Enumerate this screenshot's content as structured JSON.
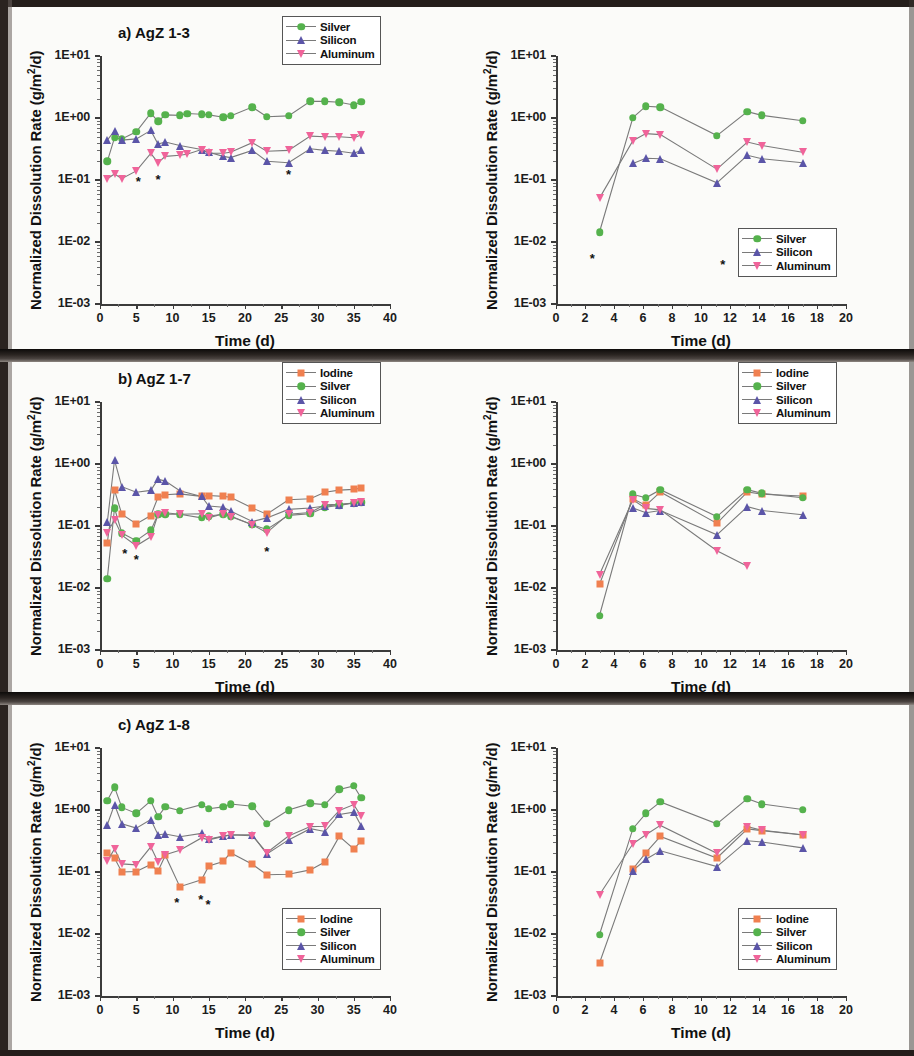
{
  "figure": {
    "axis_title_y": "Normalized Dissolution Rate (g/m2/d)",
    "axis_title_y_html": "Normalized Dissolution Rate (g/m²/d)",
    "axis_title_x": "Time (d)",
    "y_tick_labels": [
      "1E+01",
      "1E+00",
      "1E-01",
      "1E-02",
      "1E-03"
    ],
    "x_tick_labels_40": [
      "0",
      "5",
      "10",
      "15",
      "20",
      "25",
      "30",
      "35",
      "40"
    ],
    "x_tick_labels_20": [
      "0",
      "2",
      "4",
      "6",
      "8",
      "10",
      "12",
      "14",
      "16",
      "18",
      "20"
    ],
    "series_colors": {
      "Iodine": "#f08050",
      "Silver": "#55b24d",
      "Silicon": "#5b55a8",
      "Aluminum": "#f0649a",
      "line": "#7a7a7a",
      "star": "#111111"
    },
    "series_markers": {
      "Iodine": "square",
      "Silver": "circle",
      "Silicon": "triangle-up",
      "Aluminum": "triangle-down"
    }
  },
  "panels": [
    {
      "id": "a",
      "title": "a) AgZ 1-3",
      "legend_labels": [
        "Silver",
        "Silicon",
        "Aluminum"
      ],
      "legend_position": "top-right"
    },
    {
      "id": "a-right",
      "title": "",
      "legend_labels": [
        "Silver",
        "Silicon",
        "Aluminum"
      ],
      "legend_position": "bottom-right"
    },
    {
      "id": "b",
      "title": "b) AgZ 1-7",
      "legend_labels": [
        "Iodine",
        "Silver",
        "Silicon",
        "Aluminum"
      ],
      "legend_position": "top-right"
    },
    {
      "id": "b-right",
      "title": "",
      "legend_labels": [
        "Iodine",
        "Silver",
        "Silicon",
        "Aluminum"
      ],
      "legend_position": "top-right"
    },
    {
      "id": "c",
      "title": "c) AgZ 1-8",
      "legend_labels": [
        "Iodine",
        "Silver",
        "Silicon",
        "Aluminum"
      ],
      "legend_position": "bottom-right"
    },
    {
      "id": "c-right",
      "title": "",
      "legend_labels": [
        "Iodine",
        "Silver",
        "Silicon",
        "Aluminum"
      ],
      "legend_position": "bottom-right"
    }
  ],
  "chart_data": [
    {
      "panel": "a",
      "type": "line",
      "title": "a) AgZ 1-3",
      "xlabel": "Time (d)",
      "ylabel": "Normalized Dissolution Rate (g/m²/d)",
      "yscale": "log",
      "ylim": [
        0.001,
        10
      ],
      "xlim": [
        0,
        40
      ],
      "grid": false,
      "legend": "top-right",
      "series": [
        {
          "name": "Silver",
          "marker": "circle",
          "color": "#55b24d",
          "x": [
            1,
            2,
            3,
            5,
            7,
            8,
            9,
            11,
            12,
            14,
            15,
            17,
            18,
            21,
            23,
            26,
            29,
            31,
            33,
            35,
            36
          ],
          "y": [
            0.2,
            0.48,
            0.46,
            0.6,
            1.2,
            0.88,
            1.12,
            1.1,
            1.18,
            1.15,
            1.12,
            1.03,
            1.08,
            1.5,
            1.05,
            1.08,
            1.85,
            1.85,
            1.8,
            1.62,
            1.82
          ]
        },
        {
          "name": "Silicon",
          "marker": "triangle-up",
          "color": "#5b55a8",
          "x": [
            1,
            2,
            3,
            5,
            7,
            8,
            9,
            11,
            14,
            15,
            17,
            18,
            21,
            23,
            26,
            29,
            31,
            33,
            35,
            36
          ],
          "y": [
            0.44,
            0.62,
            0.44,
            0.46,
            0.63,
            0.38,
            0.41,
            0.36,
            0.31,
            0.28,
            0.24,
            0.23,
            0.3,
            0.2,
            0.19,
            0.32,
            0.3,
            0.29,
            0.27,
            0.3
          ]
        },
        {
          "name": "Aluminum",
          "marker": "triangle-down",
          "color": "#f0649a",
          "x": [
            1,
            2,
            3,
            5,
            7,
            8,
            9,
            11,
            12,
            14,
            15,
            17,
            18,
            21,
            23,
            26,
            29,
            31,
            33,
            35,
            36
          ],
          "y": [
            0.105,
            0.125,
            0.105,
            0.14,
            0.27,
            0.19,
            0.24,
            0.25,
            0.26,
            0.31,
            0.27,
            0.27,
            0.28,
            0.4,
            0.29,
            0.3,
            0.51,
            0.5,
            0.5,
            0.48,
            0.53
          ]
        }
      ],
      "annotations": [
        {
          "symbol": "*",
          "x": 5.3,
          "y": 0.095
        },
        {
          "symbol": "*",
          "x": 8.0,
          "y": 0.105
        },
        {
          "symbol": "*",
          "x": 26.0,
          "y": 0.125
        }
      ]
    },
    {
      "panel": "a-right",
      "type": "line",
      "title": "",
      "xlabel": "Time (d)",
      "ylabel": "Normalized Dissolution Rate (g/m²/d)",
      "yscale": "log",
      "ylim": [
        0.001,
        10
      ],
      "xlim": [
        0,
        20
      ],
      "grid": false,
      "legend": "bottom-right",
      "series": [
        {
          "name": "Silver",
          "marker": "circle",
          "color": "#55b24d",
          "x": [
            3.0,
            5.3,
            6.2,
            7.2,
            11.1,
            13.2,
            14.2,
            17.0
          ],
          "y": [
            0.0145,
            1.02,
            1.55,
            1.5,
            0.52,
            1.27,
            1.1,
            0.9
          ]
        },
        {
          "name": "Silicon",
          "marker": "triangle-up",
          "color": "#5b55a8",
          "x": [
            5.3,
            6.2,
            7.2,
            11.1,
            13.2,
            14.2,
            17.0
          ],
          "y": [
            0.185,
            0.225,
            0.22,
            0.09,
            0.25,
            0.22,
            0.19
          ]
        },
        {
          "name": "Aluminum",
          "marker": "triangle-down",
          "color": "#f0649a",
          "x": [
            3.0,
            5.3,
            6.2,
            7.2,
            11.1,
            13.2,
            14.2,
            17.0
          ],
          "y": [
            0.051,
            0.43,
            0.56,
            0.54,
            0.15,
            0.41,
            0.36,
            0.28
          ]
        }
      ],
      "annotations": [
        {
          "symbol": "*",
          "x": 2.5,
          "y": 0.0055
        },
        {
          "symbol": "*",
          "x": 11.5,
          "y": 0.0045
        }
      ]
    },
    {
      "panel": "b",
      "type": "line",
      "title": "b) AgZ 1-7",
      "xlabel": "Time (d)",
      "ylabel": "Normalized Dissolution Rate (g/m²/d)",
      "yscale": "log",
      "ylim": [
        0.001,
        10
      ],
      "xlim": [
        0,
        40
      ],
      "grid": false,
      "legend": "top-right",
      "series": [
        {
          "name": "Iodine",
          "marker": "square",
          "color": "#f08050",
          "x": [
            1,
            2,
            3,
            5,
            7,
            8,
            9,
            11,
            14,
            15,
            17,
            18,
            21,
            23,
            26,
            29,
            31,
            33,
            35,
            36
          ],
          "y": [
            0.054,
            0.38,
            0.155,
            0.108,
            0.147,
            0.29,
            0.32,
            0.33,
            0.3,
            0.31,
            0.3,
            0.29,
            0.195,
            0.155,
            0.265,
            0.275,
            0.35,
            0.38,
            0.39,
            0.41
          ]
        },
        {
          "name": "Silver",
          "marker": "circle",
          "color": "#55b24d",
          "x": [
            1,
            2,
            3,
            5,
            7,
            8,
            9,
            11,
            14,
            15,
            17,
            18,
            21,
            23,
            26,
            29,
            31,
            33,
            35,
            36
          ],
          "y": [
            0.0142,
            0.195,
            0.077,
            0.058,
            0.085,
            0.155,
            0.155,
            0.155,
            0.135,
            0.145,
            0.155,
            0.145,
            0.105,
            0.088,
            0.148,
            0.158,
            0.2,
            0.215,
            0.235,
            0.24
          ]
        },
        {
          "name": "Silicon",
          "marker": "triangle-up",
          "color": "#5b55a8",
          "x": [
            1,
            2,
            3,
            5,
            7,
            8,
            9,
            11,
            14,
            15,
            17,
            18,
            21,
            23,
            26,
            29,
            31,
            33,
            35,
            36
          ],
          "y": [
            0.115,
            1.15,
            0.43,
            0.35,
            0.375,
            0.57,
            0.53,
            0.37,
            0.3,
            0.21,
            0.2,
            0.175,
            0.118,
            0.135,
            0.185,
            0.195,
            0.21,
            0.22,
            0.235,
            0.245
          ]
        },
        {
          "name": "Aluminum",
          "marker": "triangle-down",
          "color": "#f0649a",
          "x": [
            1,
            2,
            3,
            5,
            7,
            8,
            9,
            11,
            14,
            15,
            17,
            18,
            21,
            23,
            26,
            29,
            31,
            33,
            35,
            36
          ],
          "y": [
            0.078,
            0.125,
            0.071,
            0.048,
            0.067,
            0.153,
            0.163,
            0.155,
            0.158,
            0.135,
            0.158,
            0.142,
            0.105,
            0.078,
            0.155,
            0.165,
            0.22,
            0.225,
            0.235,
            0.245
          ]
        }
      ],
      "annotations": [
        {
          "symbol": "*",
          "x": 3.4,
          "y": 0.037
        },
        {
          "symbol": "*",
          "x": 5.0,
          "y": 0.029
        },
        {
          "symbol": "*",
          "x": 23.0,
          "y": 0.04
        }
      ]
    },
    {
      "panel": "b-right",
      "type": "line",
      "title": "",
      "xlabel": "Time (d)",
      "ylabel": "Normalized Dissolution Rate (g/m²/d)",
      "yscale": "log",
      "ylim": [
        0.001,
        10
      ],
      "xlim": [
        0,
        20
      ],
      "grid": false,
      "legend": "top-right",
      "series": [
        {
          "name": "Iodine",
          "marker": "square",
          "color": "#f08050",
          "x": [
            3.0,
            5.3,
            6.2,
            7.2,
            11.1,
            13.2,
            14.2,
            17.0
          ],
          "y": [
            0.0115,
            0.275,
            0.215,
            0.355,
            0.11,
            0.355,
            0.325,
            0.305
          ]
        },
        {
          "name": "Silver",
          "marker": "circle",
          "color": "#55b24d",
          "x": [
            3.0,
            5.3,
            6.2,
            7.2,
            11.1,
            13.2,
            14.2,
            17.0
          ],
          "y": [
            0.0036,
            0.325,
            0.285,
            0.385,
            0.142,
            0.385,
            0.335,
            0.285
          ]
        },
        {
          "name": "Silicon",
          "marker": "triangle-up",
          "color": "#5b55a8",
          "x": [
            5.3,
            6.2,
            7.2,
            11.1,
            13.2,
            14.2,
            17.0
          ],
          "y": [
            0.195,
            0.163,
            0.178,
            0.072,
            0.205,
            0.178,
            0.152
          ]
        },
        {
          "name": "Aluminum",
          "marker": "triangle-down",
          "color": "#f0649a",
          "x": [
            3.0,
            5.3,
            6.2,
            7.2,
            11.1,
            13.2
          ],
          "y": [
            0.0165,
            0.265,
            0.192,
            0.182,
            0.04,
            0.0225
          ]
        }
      ],
      "annotations": []
    },
    {
      "panel": "c",
      "type": "line",
      "title": "c) AgZ 1-8",
      "xlabel": "Time (d)",
      "ylabel": "Normalized Dissolution Rate (g/m²/d)",
      "yscale": "log",
      "ylim": [
        0.001,
        10
      ],
      "xlim": [
        0,
        40
      ],
      "grid": false,
      "legend": "bottom-right",
      "series": [
        {
          "name": "Iodine",
          "marker": "square",
          "color": "#f08050",
          "x": [
            1,
            2,
            3,
            5,
            7,
            8,
            9,
            11,
            14,
            15,
            17,
            18,
            21,
            23,
            26,
            29,
            31,
            33,
            35,
            36
          ],
          "y": [
            0.205,
            0.168,
            0.1,
            0.102,
            0.132,
            0.103,
            0.185,
            0.058,
            0.075,
            0.125,
            0.148,
            0.205,
            0.133,
            0.09,
            0.092,
            0.108,
            0.145,
            0.375,
            0.235,
            0.315
          ]
        },
        {
          "name": "Silver",
          "marker": "circle",
          "color": "#55b24d",
          "x": [
            1,
            2,
            3,
            5,
            7,
            8,
            9,
            11,
            14,
            15,
            17,
            18,
            21,
            23,
            26,
            29,
            31,
            33,
            35,
            36
          ],
          "y": [
            1.42,
            2.35,
            1.1,
            0.88,
            1.4,
            0.78,
            1.12,
            0.98,
            1.22,
            1.05,
            1.12,
            1.25,
            1.15,
            0.6,
            1.0,
            1.28,
            1.22,
            2.15,
            2.45,
            1.58
          ]
        },
        {
          "name": "Silicon",
          "marker": "triangle-up",
          "color": "#5b55a8",
          "x": [
            1,
            2,
            3,
            5,
            7,
            8,
            9,
            11,
            14,
            15,
            17,
            18,
            21,
            23,
            26,
            29,
            31,
            33,
            35,
            36
          ],
          "y": [
            0.58,
            1.22,
            0.6,
            0.51,
            0.7,
            0.4,
            0.41,
            0.37,
            0.42,
            0.34,
            0.38,
            0.4,
            0.4,
            0.195,
            0.33,
            0.5,
            0.45,
            0.85,
            0.92,
            0.56
          ]
        },
        {
          "name": "Aluminum",
          "marker": "triangle-down",
          "color": "#f0649a",
          "x": [
            1,
            2,
            3,
            5,
            7,
            8,
            9,
            11,
            14,
            15,
            17,
            18,
            21,
            23,
            26,
            29,
            31,
            33,
            35,
            36
          ],
          "y": [
            0.15,
            0.235,
            0.135,
            0.13,
            0.255,
            0.145,
            0.19,
            0.225,
            0.355,
            0.33,
            0.375,
            0.395,
            0.385,
            0.205,
            0.38,
            0.54,
            0.545,
            0.98,
            1.22,
            0.8
          ]
        }
      ],
      "annotations": [
        {
          "symbol": "*",
          "x": 10.6,
          "y": 0.033
        },
        {
          "symbol": "*",
          "x": 13.9,
          "y": 0.037
        },
        {
          "symbol": "*",
          "x": 14.9,
          "y": 0.031
        }
      ]
    },
    {
      "panel": "c-right",
      "type": "line",
      "title": "",
      "xlabel": "Time (d)",
      "ylabel": "Normalized Dissolution Rate (g/m²/d)",
      "yscale": "log",
      "ylim": [
        0.001,
        10
      ],
      "xlim": [
        0,
        20
      ],
      "grid": false,
      "legend": "bottom-right",
      "series": [
        {
          "name": "Iodine",
          "marker": "square",
          "color": "#f08050",
          "x": [
            3.0,
            5.3,
            6.2,
            7.2,
            11.1,
            13.2,
            14.2,
            17.0
          ],
          "y": [
            0.0034,
            0.112,
            0.205,
            0.375,
            0.168,
            0.495,
            0.465,
            0.395
          ]
        },
        {
          "name": "Silver",
          "marker": "circle",
          "color": "#55b24d",
          "x": [
            3.0,
            5.3,
            6.2,
            7.2,
            11.1,
            13.2,
            14.2,
            17.0
          ],
          "y": [
            0.0098,
            0.5,
            0.88,
            1.35,
            0.6,
            1.52,
            1.25,
            1.02
          ]
        },
        {
          "name": "Silicon",
          "marker": "triangle-up",
          "color": "#5b55a8",
          "x": [
            5.3,
            6.2,
            7.2,
            11.1,
            13.2,
            14.2,
            17.0
          ],
          "y": [
            0.105,
            0.16,
            0.22,
            0.122,
            0.32,
            0.305,
            0.245
          ]
        },
        {
          "name": "Aluminum",
          "marker": "triangle-down",
          "color": "#f0649a",
          "x": [
            3.0,
            5.3,
            6.2,
            7.2,
            11.1,
            13.2,
            14.2,
            17.0
          ],
          "y": [
            0.043,
            0.285,
            0.4,
            0.565,
            0.2,
            0.54,
            0.47,
            0.4
          ]
        }
      ],
      "annotations": []
    }
  ]
}
